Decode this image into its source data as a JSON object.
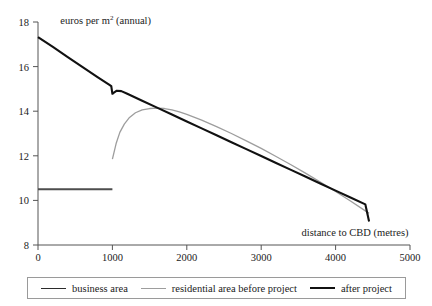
{
  "chart_data": {
    "type": "line",
    "title": "",
    "xlabel": "distance to CBD (metres)",
    "ylabel": "euros per m2 (annual)",
    "ylabel_prefix": "euros per m",
    "ylabel_superscript": "2",
    "ylabel_suffix": " (annual)",
    "xlim": [
      0,
      5000
    ],
    "ylim": [
      8,
      18
    ],
    "xticks": [
      0,
      1000,
      2000,
      3000,
      4000,
      5000
    ],
    "xtick_labels": [
      "0",
      "1000",
      "2000",
      "3000",
      "4000",
      "5000"
    ],
    "yticks": [
      8,
      10,
      12,
      14,
      16,
      18
    ],
    "ytick_labels": [
      "8",
      "10",
      "12",
      "14",
      "16",
      "18"
    ],
    "grid": false,
    "legend_position": "bottom",
    "series": [
      {
        "name": "business area",
        "color": "#4d4d4d",
        "width": 2.2,
        "points": [
          [
            0,
            10.5
          ],
          [
            1000,
            10.5
          ]
        ]
      },
      {
        "name": "residential area before project",
        "color": "#9d9d9d",
        "width": 1.3,
        "points": [
          [
            1000,
            11.85
          ],
          [
            1050,
            12.55
          ],
          [
            1100,
            13.05
          ],
          [
            1160,
            13.42
          ],
          [
            1230,
            13.72
          ],
          [
            1310,
            13.93
          ],
          [
            1400,
            14.06
          ],
          [
            1500,
            14.12
          ],
          [
            1600,
            14.14
          ],
          [
            1700,
            14.12
          ],
          [
            1800,
            14.06
          ],
          [
            1900,
            13.97
          ],
          [
            2000,
            13.86
          ],
          [
            2200,
            13.6
          ],
          [
            2400,
            13.31
          ],
          [
            2600,
            13.0
          ],
          [
            2800,
            12.67
          ],
          [
            3000,
            12.33
          ],
          [
            3200,
            11.97
          ],
          [
            3400,
            11.6
          ],
          [
            3600,
            11.21
          ],
          [
            3800,
            10.81
          ],
          [
            4000,
            10.4
          ],
          [
            4200,
            9.97
          ],
          [
            4400,
            9.53
          ],
          [
            4450,
            9.42
          ]
        ]
      },
      {
        "name": "after project",
        "color": "#111111",
        "width": 2.1,
        "points": [
          [
            0,
            17.32
          ],
          [
            200,
            16.88
          ],
          [
            400,
            16.43
          ],
          [
            600,
            15.98
          ],
          [
            800,
            15.53
          ],
          [
            950,
            15.2
          ],
          [
            985,
            15.12
          ],
          [
            1000,
            14.78
          ],
          [
            1020,
            14.83
          ],
          [
            1060,
            14.92
          ],
          [
            1120,
            14.9
          ],
          [
            1200,
            14.78
          ],
          [
            1400,
            14.47
          ],
          [
            1600,
            14.16
          ],
          [
            1800,
            13.85
          ],
          [
            2000,
            13.54
          ],
          [
            2200,
            13.23
          ],
          [
            2400,
            12.92
          ],
          [
            2600,
            12.61
          ],
          [
            2800,
            12.3
          ],
          [
            3000,
            11.99
          ],
          [
            3200,
            11.68
          ],
          [
            3400,
            11.37
          ],
          [
            3600,
            11.06
          ],
          [
            3800,
            10.75
          ],
          [
            4000,
            10.44
          ],
          [
            4200,
            10.13
          ],
          [
            4400,
            9.82
          ],
          [
            4450,
            9.05
          ]
        ]
      }
    ],
    "annotations": [
      {
        "text": "distance to CBD (metres)",
        "x": 4200,
        "y": 8.45
      },
      {
        "text": "euros per m2 (annual)",
        "x": 300,
        "y": 17.9
      }
    ]
  },
  "legend": {
    "items": [
      {
        "label": "business area",
        "style": "dark"
      },
      {
        "label": "residential area before project",
        "style": "gray"
      },
      {
        "label": "after project",
        "style": "black"
      }
    ]
  }
}
